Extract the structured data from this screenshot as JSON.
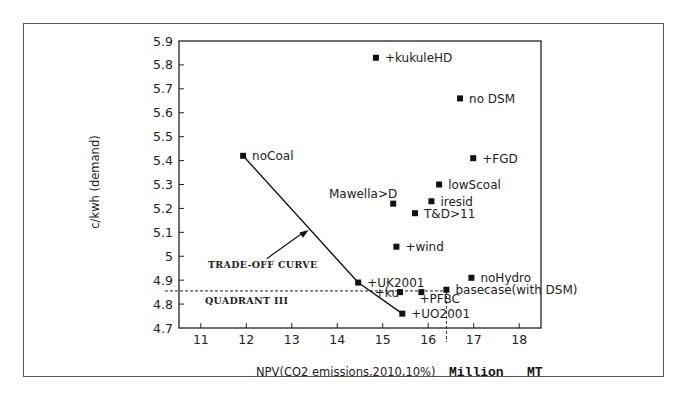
{
  "chart_data": {
    "type": "scatter",
    "title": "",
    "xlabel": "NPV(CO2 emissions,2010,10%)",
    "xlabel_units": "Million   MT",
    "ylabel": "c/kwh (demand)",
    "xlim": [
      10.52,
      18.48
    ],
    "ylim": [
      4.7,
      5.9
    ],
    "x_ticks": [
      11,
      12,
      13,
      14,
      15,
      16,
      17,
      18
    ],
    "y_ticks": [
      4.7,
      4.8,
      4.9,
      5,
      5.1,
      5.2,
      5.3,
      5.4,
      5.5,
      5.6,
      5.7,
      5.8,
      5.9
    ],
    "y_tick_labels": [
      "4.7",
      "4.8",
      "4.9",
      "5",
      "5.1",
      "5.2",
      "5.3",
      "5.4",
      "5.5",
      "5.6",
      "5.7",
      "5.8",
      "5.9"
    ],
    "grid": false,
    "legend": null,
    "points": [
      {
        "label": "+kukuleHD",
        "x": 14.85,
        "y": 5.83,
        "label_pos": "right"
      },
      {
        "label": "no DSM",
        "x": 16.7,
        "y": 5.66,
        "label_pos": "right"
      },
      {
        "label": "noCoal",
        "x": 11.93,
        "y": 5.42,
        "label_pos": "right"
      },
      {
        "label": "+FGD",
        "x": 16.99,
        "y": 5.41,
        "label_pos": "right"
      },
      {
        "label": "lowScoal",
        "x": 16.24,
        "y": 5.3,
        "label_pos": "right"
      },
      {
        "label": "Mawella>D",
        "x": 15.23,
        "y": 5.22,
        "label_pos": "above-left"
      },
      {
        "label": "iresid",
        "x": 16.07,
        "y": 5.23,
        "label_pos": "right"
      },
      {
        "label": "T&D>11",
        "x": 15.71,
        "y": 5.18,
        "label_pos": "right"
      },
      {
        "label": "+wind",
        "x": 15.3,
        "y": 5.04,
        "label_pos": "right"
      },
      {
        "label": "noHydro",
        "x": 16.95,
        "y": 4.91,
        "label_pos": "right"
      },
      {
        "label": "+UK2001",
        "x": 14.46,
        "y": 4.89,
        "label_pos": "right"
      },
      {
        "label": "basecase(with DSM)",
        "x": 16.4,
        "y": 4.86,
        "label_pos": "right"
      },
      {
        "label": "+ku",
        "x": 15.38,
        "y": 4.85,
        "label_pos": "left-below"
      },
      {
        "label": "+PFBC",
        "x": 15.85,
        "y": 4.85,
        "label_pos": "below-right"
      },
      {
        "label": "+UO2001",
        "x": 15.43,
        "y": 4.76,
        "label_pos": "right"
      }
    ],
    "tradeoff_curve": {
      "label": "TRADE-OFF CURVE",
      "points": [
        [
          11.93,
          5.42
        ],
        [
          14.46,
          4.89
        ],
        [
          15.43,
          4.76
        ]
      ],
      "arrow_from": [
        12.45,
        4.99
      ],
      "arrow_to": [
        13.37,
        5.11
      ]
    },
    "reference_lines": {
      "horizontal": {
        "y": 4.855,
        "style": "dashed",
        "label": "QUADRANT III"
      },
      "vertical": {
        "x": 16.4,
        "style": "dashed"
      }
    }
  }
}
